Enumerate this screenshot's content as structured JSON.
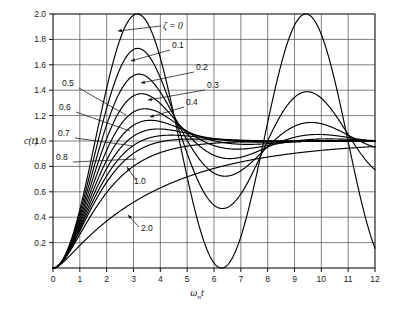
{
  "chart_data": {
    "type": "line",
    "title": "",
    "xlabel": "ωₙt",
    "ylabel": "c(t)",
    "xlim": [
      0,
      12
    ],
    "ylim": [
      0,
      2.0
    ],
    "grid": true,
    "legend_position": "inline-annotations",
    "xticks": [
      "0",
      "1",
      "2",
      "3",
      "4",
      "5",
      "6",
      "7",
      "8",
      "9",
      "10",
      "11",
      "12"
    ],
    "yticks": [
      "0.2",
      "0.4",
      "0.6",
      "0.8",
      "1.0",
      "1.2",
      "1.4",
      "1.6",
      "1.8",
      "2.0"
    ],
    "x_tick_values": [
      0,
      1,
      2,
      3,
      4,
      5,
      6,
      7,
      8,
      9,
      10,
      11,
      12
    ],
    "y_tick_values": [
      0.2,
      0.4,
      0.6,
      0.8,
      1.0,
      1.2,
      1.4,
      1.6,
      1.8,
      2.0
    ],
    "series": [
      {
        "name": "ζ = 0",
        "zeta": 0.0,
        "peak": 2.0,
        "peak_x": 3.14
      },
      {
        "name": "0.1",
        "zeta": 0.1,
        "peak": 1.73,
        "peak_x": 3.16
      },
      {
        "name": "0.2",
        "zeta": 0.2,
        "peak": 1.53,
        "peak_x": 3.21
      },
      {
        "name": "0.3",
        "zeta": 0.3,
        "peak": 1.37,
        "peak_x": 3.29
      },
      {
        "name": "0.4",
        "zeta": 0.4,
        "peak": 1.25,
        "peak_x": 3.43
      },
      {
        "name": "0.5",
        "zeta": 0.5,
        "peak": 1.16,
        "peak_x": 3.63
      },
      {
        "name": "0.6",
        "zeta": 0.6,
        "peak": 1.09,
        "peak_x": 3.93
      },
      {
        "name": "0.7",
        "zeta": 0.7,
        "peak": 1.046,
        "peak_x": 4.4
      },
      {
        "name": "0.8",
        "zeta": 0.8,
        "peak": 1.015,
        "peak_x": 5.24
      },
      {
        "name": "1.0",
        "zeta": 1.0,
        "peak": 1.0,
        "peak_x": 12.0
      },
      {
        "name": "2.0",
        "zeta": 2.0,
        "peak": 1.0,
        "peak_x": 12.0
      }
    ]
  },
  "axes": {
    "y_title": "c(t)",
    "x_title_omega": "ω",
    "x_title_sub": "n",
    "x_title_t": "t"
  },
  "annotations": {
    "zeta_equals": "ζ = 0",
    "zeta_symbol": "ζ",
    "labels": [
      {
        "text": "ζ = 0",
        "kind": "arrow-left"
      },
      {
        "text": "0.1",
        "kind": "arrow-left"
      },
      {
        "text": "0.2",
        "kind": "arrow-left"
      },
      {
        "text": "0.3",
        "kind": "arrow-left"
      },
      {
        "text": "0.4",
        "kind": "arrow-left"
      },
      {
        "text": "0.5",
        "kind": "leader-right"
      },
      {
        "text": "0.6",
        "kind": "leader-right"
      },
      {
        "text": "0.7",
        "kind": "leader-right"
      },
      {
        "text": "0.8",
        "kind": "leader-right"
      },
      {
        "text": "1.0",
        "kind": "arrow-up"
      },
      {
        "text": "2.0",
        "kind": "arrow-up"
      }
    ]
  },
  "colors": {
    "curve": "#000000",
    "grid": "#4a4a4a",
    "axis": "#111111",
    "background": "#ffffff",
    "text": "#111111"
  },
  "label_text": {
    "t0": "ζ = 0",
    "t01": "0.1",
    "t02": "0.2",
    "t03": "0.3",
    "t04": "0.4",
    "t05": "0.5",
    "t06": "0.6",
    "t07": "0.7",
    "t08": "0.8",
    "t10": "1.0",
    "t20": "2.0"
  }
}
